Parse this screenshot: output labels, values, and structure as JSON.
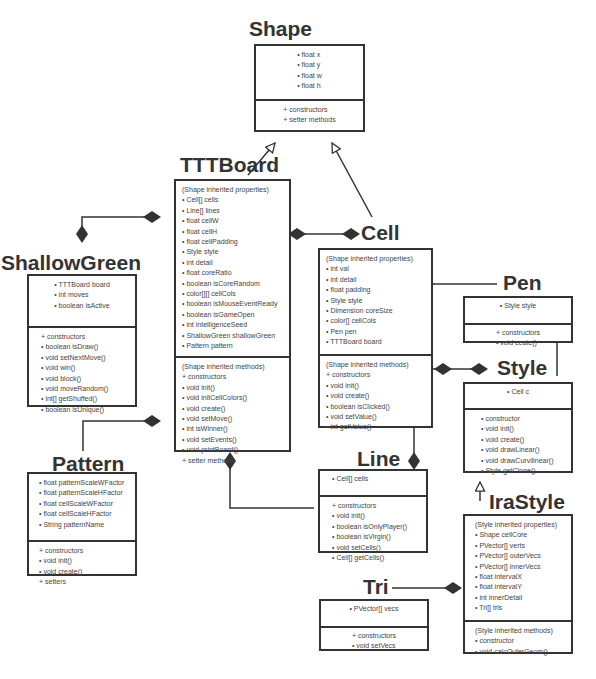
{
  "classes": {
    "shape": {
      "name": "Shape",
      "properties": [
        "• float x",
        "• float y",
        "• float w",
        "• float h"
      ],
      "methods": [
        "+ constructors",
        "+ setter methods"
      ]
    },
    "tttboard": {
      "name": "TTTBoard",
      "properties": [
        "(Shape inherited properties)",
        "• Cell[] cells",
        "• Line[] lines",
        "• float cellW",
        "• float cellH",
        "• float cellPadding",
        "• Style style",
        "• int detail",
        "• float coreRatio",
        "• boolean isCoreRandom",
        "• color[][] cellCols",
        "• boolean isMouseEventReady",
        "• boolean isGameOpen",
        "• int intelligenceSeed",
        "• ShallowGreen shallowGreen",
        "• Pattern pattern"
      ],
      "methods": [
        "(Shape inherited methods)",
        "+ constructors",
        "• void init()",
        "• void initCellColors()",
        "• void create()",
        "• void setMove()",
        "• int isWinner()",
        "• void setEvents()",
        "• void printBoard()",
        "+ setter methods"
      ]
    },
    "shallowgreen": {
      "name": "ShallowGreen",
      "properties": [
        "• TTTBoard board",
        "• int moves",
        "• boolean isActive"
      ],
      "methods": [
        "+ constructors",
        "• boolean isDraw()",
        "• void setNextMove()",
        "• void win()",
        "• void block()",
        "• void moveRandom()",
        "• int[] getShuffed()",
        "• boolean isUnique()"
      ]
    },
    "pattern": {
      "name": "Pattern",
      "properties": [
        "• float patternScaleWFactor",
        "• float patternScaleHFactor",
        "• float cellScaleWFactor",
        "• float cellScaleHFactor",
        "• String patternName"
      ],
      "methods": [
        "+ constructors",
        "• void init()",
        "• void create()",
        "+ setters"
      ]
    },
    "cell": {
      "name": "Cell",
      "properties": [
        "(Shape inherited properties)",
        "• int val",
        "• int detail",
        "• float padding",
        "• Style style",
        "• Dimension coreSize",
        "• color[] cellCols",
        "• Pen pen",
        "• TTTBoard board"
      ],
      "methods": [
        "(Shape inherited methods)",
        "+ constructors",
        "• void init()",
        "• void create()",
        "• boolean isClicked()",
        "• void setValue()",
        "• int getValue()"
      ]
    },
    "pen": {
      "name": "Pen",
      "properties": [
        "• Style style"
      ],
      "methods": [
        "+ constructors",
        "• void ceate()"
      ]
    },
    "style": {
      "name": "Style",
      "properties": [
        "• Cell c"
      ],
      "methods": [
        "• constructor",
        "• void init()",
        "• void create()",
        "• void drawLinear()",
        "• void drawCurvilinear()",
        "• Style getClone()"
      ]
    },
    "line": {
      "name": "Line",
      "properties": [
        "• Cell[] cells"
      ],
      "methods": [
        "+ constructors",
        "• void init()",
        "• boolean isOnlyPlayer()",
        "• boolean isVirgin()",
        "• void setCells()",
        "• Cell[] getCells()"
      ]
    },
    "irastyle": {
      "name": "IraStyle",
      "properties": [
        "(Style inherited properties)",
        "• Shape cellCore",
        "• PVector[] verts",
        "• PVector[] outerVecs",
        "• PVector[] innerVecs",
        "• float intervalX",
        "• float intervalY",
        "• int innerDetail",
        "• Tri[] tris"
      ],
      "methods": [
        "(Style inherited methods)",
        "• constructor",
        "• void calcOuterGeom()"
      ]
    },
    "tri": {
      "name": "Tri",
      "properties": [
        "• PVector[] vecs"
      ],
      "methods": [
        "+ constructors",
        "• void setVecs"
      ]
    }
  },
  "relationships": [
    {
      "type": "inheritance",
      "from": "TTTBoard",
      "to": "Shape"
    },
    {
      "type": "inheritance",
      "from": "Cell",
      "to": "Shape"
    },
    {
      "type": "inheritance",
      "from": "IraStyle",
      "to": "Style"
    },
    {
      "type": "composition",
      "from": "TTTBoard",
      "to": "ShallowGreen"
    },
    {
      "type": "composition",
      "from": "TTTBoard",
      "to": "Cell"
    },
    {
      "type": "composition",
      "from": "TTTBoard",
      "to": "Pattern"
    },
    {
      "type": "composition",
      "from": "TTTBoard",
      "to": "Line"
    },
    {
      "type": "composition",
      "from": "Cell",
      "to": "Pen"
    },
    {
      "type": "composition",
      "from": "Cell",
      "to": "Style"
    },
    {
      "type": "composition",
      "from": "Cell",
      "to": "Line"
    },
    {
      "type": "composition",
      "from": "Pen",
      "to": "Style"
    },
    {
      "type": "composition",
      "from": "IraStyle",
      "to": "Tri"
    }
  ],
  "colors": {
    "stroke": "#333333",
    "text": "#444444",
    "background": "#ffffff"
  }
}
